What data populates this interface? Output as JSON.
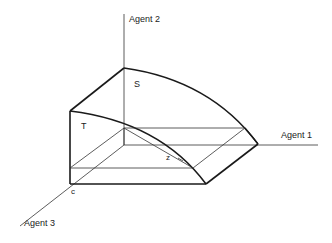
{
  "diagram": {
    "axes": {
      "agent1": "Agent 1",
      "agent2": "Agent 2",
      "agent3": "Agent 3"
    },
    "regions": {
      "s": "S",
      "t": "T"
    },
    "points": {
      "c": "c",
      "z": "z"
    },
    "colors": {
      "line": "#1a1a1a",
      "background": "#ffffff"
    }
  }
}
